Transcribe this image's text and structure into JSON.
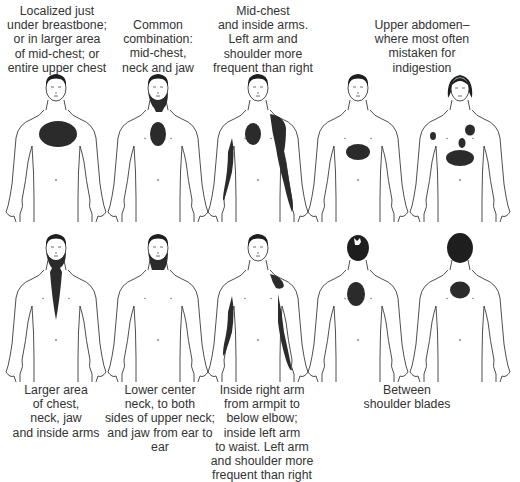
{
  "colors": {
    "pain": "#2b2b2b",
    "outline": "#3a3a3a",
    "background": "#ffffff",
    "text": "#333333"
  },
  "top_row": [
    {
      "label": "Localized just\nunder breastbone;\nor in larger area\nof mid-chest; or\nentire upper chest",
      "view": "front-male",
      "pain_areas": [
        "large-upper-chest-oval"
      ]
    },
    {
      "label": "Common\ncombination:\nmid-chest,\nneck and jaw",
      "view": "front-male",
      "pain_areas": [
        "mid-chest-oval",
        "neck-jaw"
      ]
    },
    {
      "label": "Mid-chest\nand inside arms.\nLeft arm and\nshoulder more\nfrequent than right",
      "view": "front-male",
      "pain_areas": [
        "mid-chest-oval",
        "left-shoulder-arm",
        "right-inner-arm"
      ]
    },
    {
      "label": "Upper abdomen–\nwhere most often\nmistaken for\nindigestion",
      "view": "front-male",
      "pain_areas": [
        "upper-abdomen-oval"
      ]
    },
    {
      "label": "",
      "view": "front-female",
      "pain_areas": [
        "upper-abdomen-oval",
        "left-chest-spot",
        "mid-chest-spot",
        "right-arm-spot"
      ]
    }
  ],
  "bottom_row": [
    {
      "label": "Larger area\nof chest,\nneck, jaw\nand inside arms",
      "view": "front-male",
      "pain_areas": [
        "neck-jaw-chest-wedge"
      ]
    },
    {
      "label": "Lower center\nneck, to both\nsides of upper neck;\nand jaw from ear to ear",
      "view": "front-male",
      "pain_areas": [
        "neck-jaw"
      ]
    },
    {
      "label": "Inside right arm\nfrom armpit to\nbelow elbow;\ninside left arm\nto waist. Left arm\nand shoulder more\nfrequent than right",
      "view": "front-male",
      "pain_areas": [
        "left-shoulder",
        "left-inner-arm",
        "right-inner-arm"
      ]
    },
    {
      "label": "Between\nshoulder blades",
      "view": "back-male",
      "pain_areas": [
        "between-shoulder-blades-oval"
      ]
    },
    {
      "label": "",
      "view": "back-female",
      "pain_areas": [
        "between-shoulder-blades-circle"
      ]
    }
  ]
}
